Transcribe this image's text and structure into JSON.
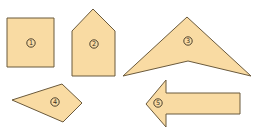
{
  "diagram": {
    "fill_color": "#f9dba3",
    "stroke_color": "#6b5a3c",
    "shapes": [
      {
        "id": 1,
        "label": "①",
        "number": "1",
        "kind": "square",
        "points": "7,18 54,18 54,67 7,67",
        "label_pos": [
          31,
          43
        ]
      },
      {
        "id": 2,
        "label": "②",
        "number": "2",
        "kind": "pentagon",
        "points": "93,9 115,31 115,76 72,76 72,31",
        "label_pos": [
          94,
          44
        ]
      },
      {
        "id": 3,
        "label": "③",
        "number": "3",
        "kind": "concave-quadrilateral",
        "points": "187,17 251,76 188,61 123,76",
        "label_pos": [
          188,
          41
        ]
      },
      {
        "id": 4,
        "label": "④",
        "number": "4",
        "kind": "quadrilateral",
        "points": "12,100 62,84 82,103 63,122",
        "label_pos": [
          55,
          102
        ]
      },
      {
        "id": 5,
        "label": "⑤",
        "number": "5",
        "kind": "arrow",
        "points": "146,104 166,80 166,93 240,93 240,114 166,114 166,127",
        "label_pos": [
          158,
          103
        ]
      }
    ]
  }
}
